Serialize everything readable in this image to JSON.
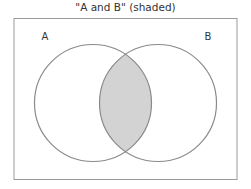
{
  "diagram": {
    "title": "\"A and B\" (shaded)",
    "type": "venn",
    "sets": [
      {
        "label": "A",
        "cx": 93,
        "cy": 103,
        "r": 58.5
      },
      {
        "label": "B",
        "cx": 158,
        "cy": 103,
        "r": 58.5
      }
    ],
    "shaded_region": "A ∩ B",
    "colors": {
      "stroke": "#8a8a8a",
      "shade": "#d3d3d3",
      "frame": "#9a9a9a"
    }
  }
}
